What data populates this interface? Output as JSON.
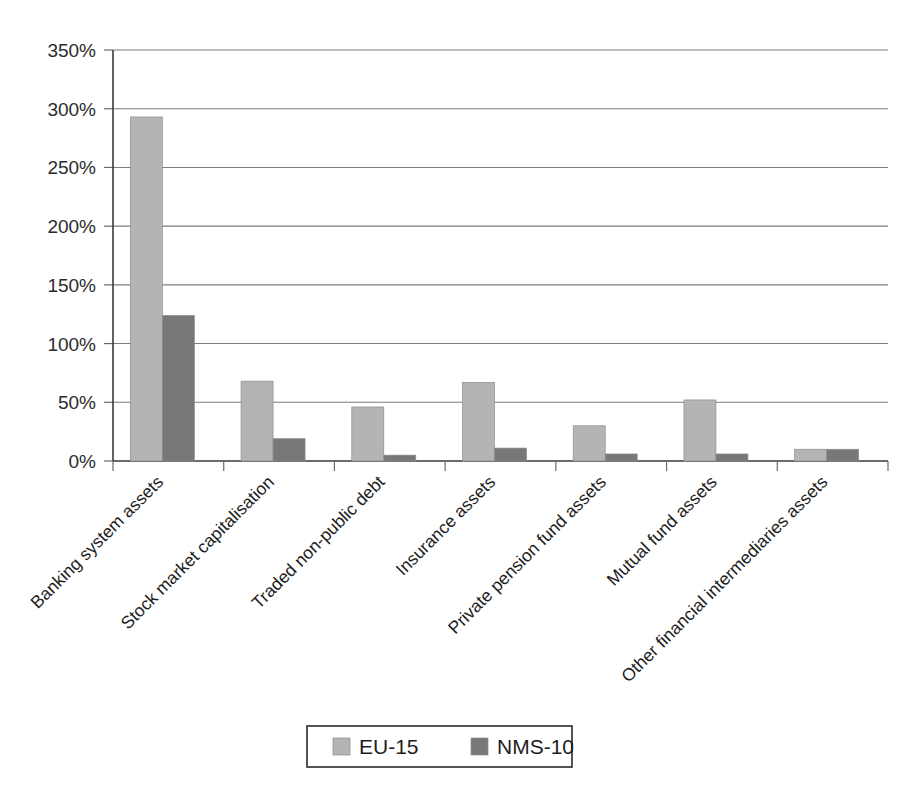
{
  "chart_data": {
    "type": "bar",
    "title": "",
    "subtitle": "",
    "xlabel": "",
    "ylabel": "",
    "ylim": [
      0,
      350
    ],
    "y_tick_labels": [
      "0%",
      "50%",
      "100%",
      "150%",
      "200%",
      "250%",
      "300%",
      "350%"
    ],
    "y_tick_values": [
      0,
      50,
      100,
      150,
      200,
      250,
      300,
      350
    ],
    "y_unit": "%",
    "grid": "horizontal",
    "legend_position": "bottom-center",
    "categories": [
      "Banking system assets",
      "Stock market capitalisation",
      "Traded non-public debt",
      "Insurance assets",
      "Private pension fund assets",
      "Mutual fund assets",
      "Other financial intermediaries assets"
    ],
    "series": [
      {
        "name": "EU-15",
        "color": "#b4b4b4",
        "values": [
          293,
          68,
          46,
          67,
          30,
          52,
          10
        ]
      },
      {
        "name": "NMS-10",
        "color": "#787878",
        "values": [
          124,
          19,
          5,
          11,
          6,
          6,
          10
        ]
      }
    ]
  },
  "legend": {
    "entries": [
      {
        "label": "EU-15",
        "swatch_color": "#b4b4b4"
      },
      {
        "label": "NMS-10",
        "swatch_color": "#787878"
      }
    ]
  },
  "axes": {
    "y_axis_name": "percent-axis",
    "x_axis_name": "category-axis"
  }
}
